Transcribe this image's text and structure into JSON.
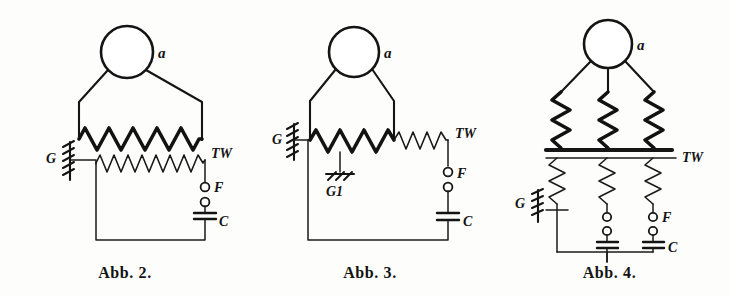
{
  "page": {
    "background_color": "#fdfdfc",
    "ink_color": "#141414"
  },
  "figures": [
    {
      "id": "fig2",
      "caption": "Abb. 2.",
      "description": "Antenne mit dickem Kopplungsdraht und parallelem Tesla-Wicklungskreis, Funkenstrecke und Kondensator",
      "labels": {
        "antenna": "a",
        "ground": "G",
        "tesla_winding": "TW",
        "spark_gap": "F",
        "capacitor": "C"
      },
      "components": [
        {
          "name": "antenna-circle",
          "label": "a",
          "type": "antenna"
        },
        {
          "name": "primary-coil",
          "label": "",
          "type": "coil-thick",
          "turns": 10
        },
        {
          "name": "secondary-coil",
          "label": "TW",
          "type": "coil-thin",
          "turns": 16
        },
        {
          "name": "ground-symbol",
          "label": "G",
          "type": "ground-hatched"
        },
        {
          "name": "spark-gap",
          "label": "F",
          "type": "spark-gap"
        },
        {
          "name": "capacitor",
          "label": "C",
          "type": "capacitor"
        }
      ]
    },
    {
      "id": "fig3",
      "caption": "Abb. 3.",
      "description": "Antenne mit Serienschaltung von dickem und duennem Wicklungsteil, zweite Erdung G1 an Anzapfung",
      "labels": {
        "antenna": "a",
        "ground": "G",
        "ground_tap": "G1",
        "ground_tap_sub": "1",
        "tesla_winding": "TW",
        "spark_gap": "F",
        "capacitor": "C"
      },
      "components": [
        {
          "name": "antenna-circle",
          "label": "a",
          "type": "antenna"
        },
        {
          "name": "primary-coil",
          "label": "",
          "type": "coil-thick",
          "turns": 7
        },
        {
          "name": "secondary-coil",
          "label": "TW",
          "type": "coil-thin",
          "turns": 7
        },
        {
          "name": "ground-symbol",
          "label": "G",
          "type": "ground-hatched"
        },
        {
          "name": "ground-tap-symbol",
          "label": "G1",
          "type": "ground-tap"
        },
        {
          "name": "spark-gap",
          "label": "F",
          "type": "spark-gap"
        },
        {
          "name": "capacitor",
          "label": "C",
          "type": "capacitor"
        }
      ]
    },
    {
      "id": "fig4",
      "caption": "Abb. 4.",
      "description": "Antenne mit drei parallelen dicken Wicklungen auf Sammelschiene, drei duenne Wicklungen mit Funkenstrecken und Kondensatoren",
      "labels": {
        "antenna": "a",
        "ground": "G",
        "tesla_winding": "TW",
        "spark_gap": "F",
        "capacitor": "C"
      },
      "components": [
        {
          "name": "antenna-circle",
          "label": "a",
          "type": "antenna"
        },
        {
          "name": "primary-coil-left",
          "label": "",
          "type": "coil-thick",
          "turns": 6
        },
        {
          "name": "primary-coil-middle",
          "label": "",
          "type": "coil-thick",
          "turns": 6
        },
        {
          "name": "primary-coil-right",
          "label": "",
          "type": "coil-thick",
          "turns": 6
        },
        {
          "name": "bus-bar",
          "label": "TW",
          "type": "bus-bar"
        },
        {
          "name": "secondary-coil-left",
          "label": "",
          "type": "coil-thin",
          "turns": 8
        },
        {
          "name": "secondary-coil-middle",
          "label": "",
          "type": "coil-thin",
          "turns": 8
        },
        {
          "name": "secondary-coil-right",
          "label": "",
          "type": "coil-thin",
          "turns": 8
        },
        {
          "name": "ground-symbol",
          "label": "G",
          "type": "ground-hatched"
        },
        {
          "name": "spark-gap-middle",
          "label": "",
          "type": "spark-gap"
        },
        {
          "name": "spark-gap-right",
          "label": "F",
          "type": "spark-gap"
        },
        {
          "name": "capacitor-middle",
          "label": "",
          "type": "capacitor"
        },
        {
          "name": "capacitor-right",
          "label": "C",
          "type": "capacitor"
        }
      ]
    }
  ]
}
